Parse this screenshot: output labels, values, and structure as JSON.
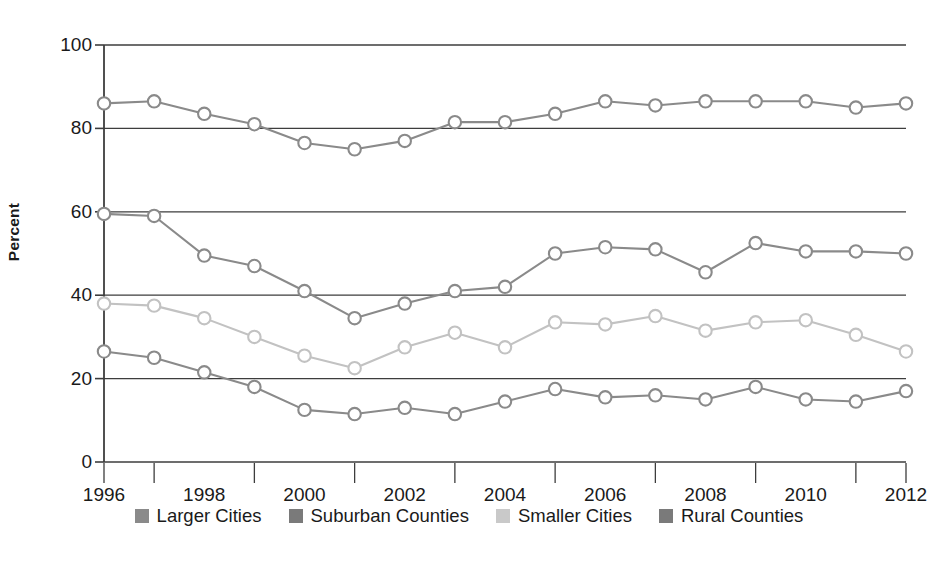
{
  "chart_data": {
    "type": "line",
    "title": "",
    "subtitle": "",
    "xlabel": "",
    "ylabel": "Percent",
    "xlim": [
      1996,
      2012
    ],
    "ylim": [
      0,
      100
    ],
    "yticks": [
      0,
      20,
      40,
      60,
      80,
      100
    ],
    "xticks": [
      1996,
      1998,
      2000,
      2002,
      2004,
      2006,
      2008,
      2010,
      2012
    ],
    "grid": "horizontal",
    "legend_position": "bottom",
    "marker": "open-circle",
    "x": [
      1996,
      1997,
      1998,
      1999,
      2000,
      2001,
      2002,
      2003,
      2004,
      2005,
      2006,
      2007,
      2008,
      2009,
      2010,
      2011,
      2012
    ],
    "series": [
      {
        "name": "Larger Cities",
        "color": "#8a8a8a",
        "values": [
          86,
          86.5,
          83.5,
          81,
          76.5,
          75,
          77,
          81.5,
          81.5,
          83.5,
          86.5,
          85.5,
          86.5,
          86.5,
          86.5,
          85,
          86
        ]
      },
      {
        "name": "Suburban Counties",
        "color": "#8a8a8a",
        "values": [
          59.5,
          59,
          49.5,
          47,
          41,
          34.5,
          38,
          41,
          42,
          50,
          51.5,
          51,
          45.5,
          52.5,
          50.5,
          50.5,
          50
        ]
      },
      {
        "name": "Smaller Cities",
        "color": "#c2c2c2",
        "values": [
          38,
          37.5,
          34.5,
          30,
          25.5,
          22.5,
          27.5,
          31,
          27.5,
          33.5,
          33,
          35,
          31.5,
          33.5,
          34,
          30.5,
          26.5
        ]
      },
      {
        "name": "Rural Counties",
        "color": "#8a8a8a",
        "values": [
          26.5,
          25,
          21.5,
          18,
          12.5,
          11.5,
          13,
          11.5,
          14.5,
          17.5,
          15.5,
          16,
          15,
          18,
          15,
          14.5,
          17
        ]
      }
    ]
  },
  "legend": {
    "items": [
      {
        "label": "Larger Cities",
        "color": "#8a8a8a"
      },
      {
        "label": "Suburban Counties",
        "color": "#7a7a7a"
      },
      {
        "label": "Smaller Cities",
        "color": "#c9c9c9"
      },
      {
        "label": "Rural Counties",
        "color": "#7a7a7a"
      }
    ]
  },
  "axes": {
    "y_label": "Percent",
    "y_ticks": [
      "0",
      "20",
      "40",
      "60",
      "80",
      "100"
    ],
    "x_ticks": [
      "1996",
      "1998",
      "2000",
      "2002",
      "2004",
      "2006",
      "2008",
      "2010",
      "2012"
    ]
  }
}
